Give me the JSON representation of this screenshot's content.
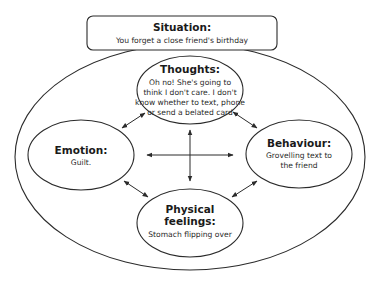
{
  "situation": {
    "title": "Situation:",
    "text": "You forget a close friend's birthday"
  },
  "thoughts": {
    "title": "Thoughts:",
    "lines": [
      "Oh no! She's going to",
      "think I don't care. I don't",
      "know whether to text, phone",
      "or send a belated card"
    ]
  },
  "emotion": {
    "title": "Emotion:",
    "lines": [
      "Guilt."
    ]
  },
  "behaviour": {
    "title": "Behaviour:",
    "lines": [
      "Grovelling text to",
      "the friend"
    ]
  },
  "physical": {
    "title_lines": [
      "Physical",
      "feelings:"
    ],
    "lines": [
      "Stomach flipping over"
    ]
  },
  "connections": [
    {
      "from": "thoughts",
      "to": "emotion",
      "type": "bidirectional"
    },
    {
      "from": "thoughts",
      "to": "behaviour",
      "type": "bidirectional"
    },
    {
      "from": "emotion",
      "to": "physical",
      "type": "bidirectional"
    },
    {
      "from": "behaviour",
      "to": "physical",
      "type": "bidirectional"
    },
    {
      "from": "emotion",
      "to": "behaviour",
      "type": "bidirectional"
    },
    {
      "from": "thoughts",
      "to": "physical",
      "type": "bidirectional"
    }
  ]
}
